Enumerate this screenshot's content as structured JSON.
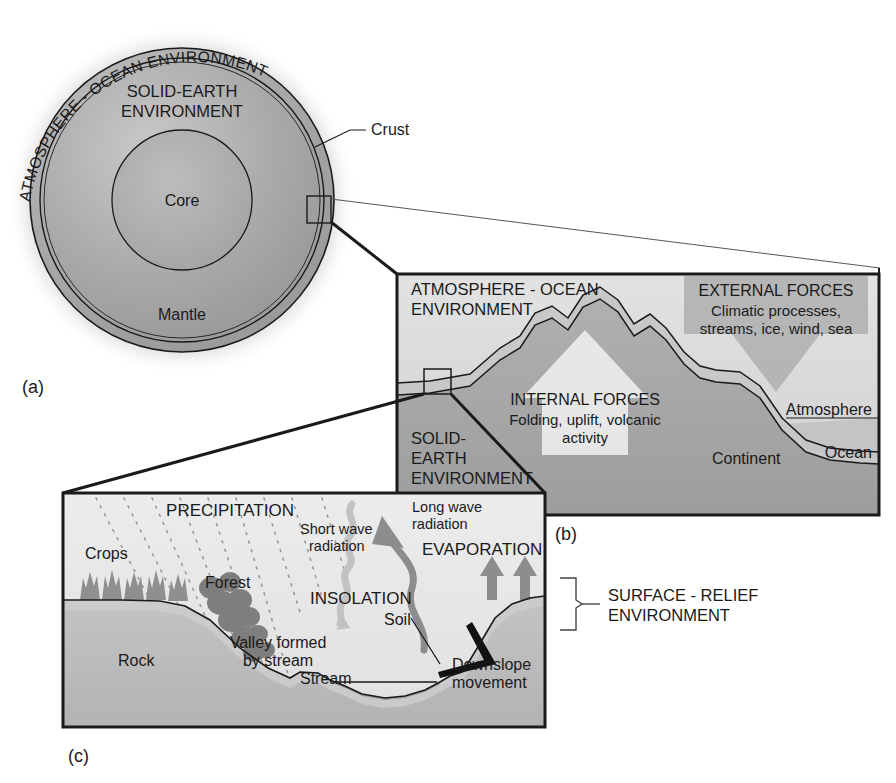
{
  "figure": {
    "panel_labels": {
      "a": "(a)",
      "b": "(b)",
      "c": "(c)"
    }
  },
  "panel_a": {
    "name": "whole-earth-cross-section",
    "curved_label": "ATMOSPHERE - OCEAN ENVIRONMENT",
    "inner_title_line1": "SOLID-EARTH",
    "inner_title_line2": "ENVIRONMENT",
    "core_label": "Core",
    "mantle_label": "Mantle",
    "crust_label": "Crust",
    "colors": {
      "crust_ring": "#b4b4b4",
      "mantle": "#a9a9a9",
      "core": "#adadad",
      "halo": "#d9d9d9",
      "stroke": "#1a1a1a"
    }
  },
  "panel_b": {
    "name": "continent-ocean-cross-section",
    "env_label_line1": "ATMOSPHERE - OCEAN",
    "env_label_line2": "ENVIRONMENT",
    "solid_earth_line1": "SOLID-",
    "solid_earth_line2": "EARTH",
    "solid_earth_line3": "ENVIRONMENT",
    "external_forces": {
      "heading": "EXTERNAL FORCES",
      "line1": "Climatic processes,",
      "line2": "streams, ice, wind, sea"
    },
    "internal_forces": {
      "heading": "INTERNAL FORCES",
      "line1": "Folding, uplift, volcanic",
      "line2": "activity"
    },
    "atmosphere_label": "Atmosphere",
    "ocean_label": "Ocean",
    "continent_label": "Continent",
    "colors": {
      "sky": "#d8d8d8",
      "crust_band": "#c6c6c6",
      "mantle": "#a6a6a6",
      "ocean": "#c9c9c9",
      "external_arrow": "#b0b0b0",
      "internal_arrow": "#e6e6e6",
      "stroke": "#1a1a1a"
    }
  },
  "panel_c": {
    "name": "valley-hydrology-cross-section",
    "precipitation_label": "PRECIPITATION",
    "short_wave_line1": "Short wave",
    "short_wave_line2": "radiation",
    "long_wave_line1": "Long wave",
    "long_wave_line2": "radiation",
    "evaporation_label": "EVAPORATION",
    "insolation_label": "INSOLATION",
    "crops_label": "Crops",
    "forest_label": "Forest",
    "soil_label": "Soil",
    "rock_label": "Rock",
    "stream_label": "Stream",
    "valley_line1": "Valley formed",
    "valley_line2": "by stream",
    "downslope_line1": "Downslope",
    "downslope_line2": "movement",
    "colors": {
      "sky": "#e8e8e8",
      "rock": "#bdbdbd",
      "soil": "#c9c9c9",
      "vegetation": "#8d8d8d",
      "arrow": "#9a9a9a",
      "stroke": "#1a1a1a"
    }
  },
  "bracket_label": {
    "line1": "SURFACE - RELIEF",
    "line2": "ENVIRONMENT"
  }
}
